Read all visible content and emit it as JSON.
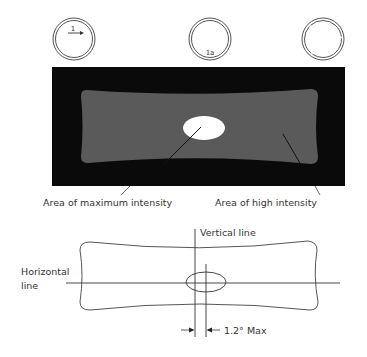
{
  "circles": [
    {
      "label": "1",
      "has_arrow": true
    },
    {
      "label": "1a",
      "has_arrow": false
    },
    {
      "label": "",
      "has_arrow": false
    }
  ],
  "intensity_image": {
    "labels": {
      "max": "Area of maximum intensity",
      "high": "Area of high intensity"
    },
    "colors": {
      "background": "#0a0a0a",
      "high_area": "#5a5a5a",
      "max_area": "#ffffff"
    }
  },
  "line_diagram": {
    "labels": {
      "vertical": "Vertical line",
      "horizontal_1": "Horizontal",
      "horizontal_2": "line",
      "tolerance": "1.2° Max"
    }
  }
}
